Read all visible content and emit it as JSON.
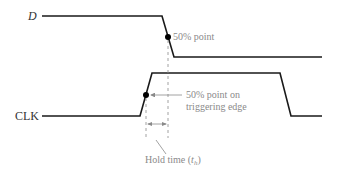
{
  "diagram": {
    "signals": [
      {
        "name": "D",
        "italic": true
      },
      {
        "name": "CLK",
        "italic": false
      }
    ],
    "annotations": {
      "d_midpoint": "50% point",
      "clk_midpoint_line1": "50% point on",
      "clk_midpoint_line2": "triggering edge",
      "hold_time_prefix": "Hold time (",
      "hold_time_symbol": "t",
      "hold_time_subscript": "h",
      "hold_time_suffix": ")"
    },
    "colors": {
      "waveform": "#1a1a1a",
      "annotation": "#8a8a8a",
      "background": "#ffffff"
    }
  }
}
